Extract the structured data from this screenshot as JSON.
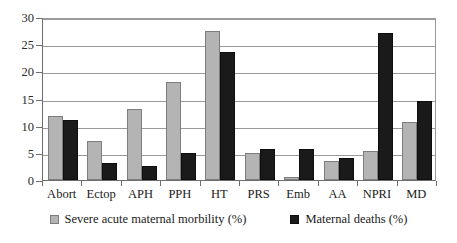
{
  "chart_data": {
    "type": "bar",
    "title": "",
    "subtitle": "",
    "xlabel": "",
    "ylabel": "",
    "ylim": [
      0,
      30
    ],
    "ytick_step": 5,
    "yticks": [
      0,
      5,
      10,
      15,
      20,
      25,
      30
    ],
    "grid": true,
    "legend_position": "bottom",
    "categories": [
      "Abort",
      "Ectop",
      "APH",
      "PPH",
      "HT",
      "PRS",
      "Emb",
      "AA",
      "NPRI",
      "MD"
    ],
    "series": [
      {
        "name": "Severe acute maternal morbility (%)",
        "color": "#b4b4b4",
        "values": [
          11.7,
          7.1,
          13.0,
          18.1,
          27.5,
          5.0,
          0.5,
          3.5,
          5.3,
          10.6
        ]
      },
      {
        "name": "Maternal deaths (%)",
        "color": "#1a1a1a",
        "values": [
          11.0,
          3.1,
          2.5,
          4.9,
          23.5,
          5.8,
          5.8,
          4.1,
          27.0,
          14.5
        ]
      }
    ]
  }
}
